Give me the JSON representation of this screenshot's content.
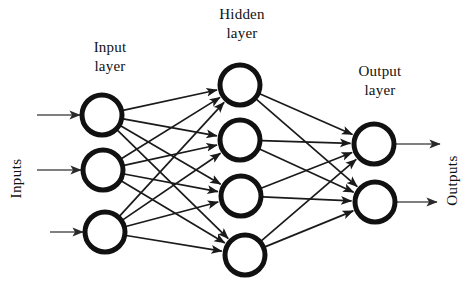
{
  "diagram": {
    "background": "#ffffff",
    "ink": "#111111",
    "node_fill": "#ffffff",
    "node_stroke": "#111111",
    "edge_color": "#1a1a1a",
    "io_arrow_color": "#555555",
    "labels": {
      "input_layer": "Input\nlayer",
      "hidden_layer": "Hidden\nlayer",
      "output_layer": "Output\nlayer",
      "inputs": "Inputs",
      "outputs": "Outputs"
    },
    "layers": [
      {
        "name": "input",
        "label": "Input layer",
        "count": 3,
        "radius": 20,
        "stroke_width": 5,
        "nodes": [
          {
            "id": "i1",
            "cx": 102,
            "cy": 115
          },
          {
            "id": "i2",
            "cx": 103,
            "cy": 170
          },
          {
            "id": "i3",
            "cx": 105,
            "cy": 232
          }
        ]
      },
      {
        "name": "hidden",
        "label": "Hidden layer",
        "count": 4,
        "radius": 20,
        "stroke_width": 5,
        "nodes": [
          {
            "id": "h1",
            "cx": 240,
            "cy": 85
          },
          {
            "id": "h2",
            "cx": 240,
            "cy": 140
          },
          {
            "id": "h3",
            "cx": 241,
            "cy": 196
          },
          {
            "id": "h4",
            "cx": 245,
            "cy": 255
          }
        ]
      },
      {
        "name": "output",
        "label": "Output layer",
        "count": 2,
        "radius": 20,
        "stroke_width": 5,
        "nodes": [
          {
            "id": "o1",
            "cx": 374,
            "cy": 144
          },
          {
            "id": "o2",
            "cx": 375,
            "cy": 202
          }
        ]
      }
    ],
    "connections": {
      "input_to_hidden": [
        [
          "i1",
          "h1"
        ],
        [
          "i1",
          "h2"
        ],
        [
          "i1",
          "h3"
        ],
        [
          "i1",
          "h4"
        ],
        [
          "i2",
          "h1"
        ],
        [
          "i2",
          "h2"
        ],
        [
          "i2",
          "h3"
        ],
        [
          "i2",
          "h4"
        ],
        [
          "i3",
          "h1"
        ],
        [
          "i3",
          "h2"
        ],
        [
          "i3",
          "h3"
        ],
        [
          "i3",
          "h4"
        ]
      ],
      "hidden_to_output": [
        [
          "h1",
          "o1"
        ],
        [
          "h1",
          "o2"
        ],
        [
          "h2",
          "o1"
        ],
        [
          "h2",
          "o2"
        ],
        [
          "h3",
          "o1"
        ],
        [
          "h3",
          "o2"
        ],
        [
          "h4",
          "o1"
        ],
        [
          "h4",
          "o2"
        ]
      ]
    },
    "input_arrows": [
      {
        "x1": 37,
        "y1": 115,
        "x2": 80,
        "y2": 115
      },
      {
        "x1": 37,
        "y1": 170,
        "x2": 81,
        "y2": 170
      },
      {
        "x1": 50,
        "y1": 232,
        "x2": 83,
        "y2": 232
      }
    ],
    "output_arrows": [
      {
        "x1": 394,
        "y1": 144,
        "x2": 440,
        "y2": 144
      },
      {
        "x1": 395,
        "y1": 202,
        "x2": 437,
        "y2": 202
      }
    ]
  }
}
